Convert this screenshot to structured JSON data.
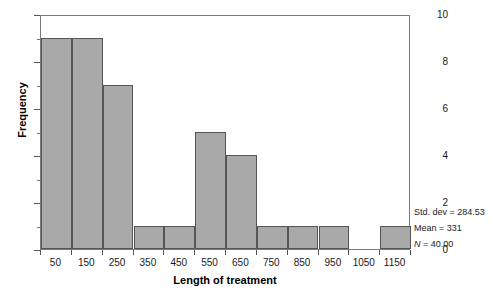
{
  "chart_data": {
    "type": "bar",
    "title": "",
    "subtitle": "",
    "xlabel": "Length of treatment",
    "ylabel": "Frequency",
    "categories": [
      "50",
      "150",
      "250",
      "350",
      "450",
      "550",
      "650",
      "750",
      "850",
      "950",
      "1050",
      "1150"
    ],
    "values": [
      9,
      9,
      7,
      1,
      1,
      5,
      4,
      1,
      1,
      1,
      0,
      1
    ],
    "xtick_labels": [
      "50",
      "150",
      "250",
      "350",
      "450",
      "550",
      "650",
      "750",
      "850",
      "950",
      "1050",
      "1150"
    ],
    "ytick_labels": [
      "0",
      "2",
      "4",
      "6",
      "8",
      "10"
    ],
    "ytick_values": [
      0,
      2,
      4,
      6,
      8,
      10
    ],
    "ylim": [
      0,
      10
    ],
    "xlim": [
      0,
      1200
    ],
    "bin_width": 100,
    "grid": false,
    "legend": false,
    "bar_fill_color": "#a9a9a9",
    "bar_edge_color": "#555555",
    "frame_color": "#7a7a7a"
  },
  "annotations": {
    "std_dev": "Std. dev = 284.53",
    "mean": "Mean = 331",
    "n_prefix": "N",
    "n_value": " = 40.00"
  }
}
